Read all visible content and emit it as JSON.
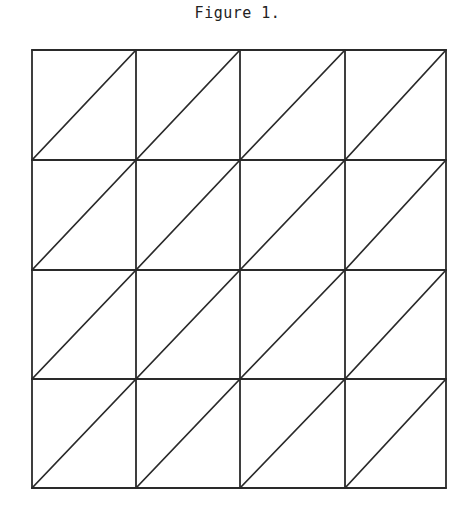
{
  "figure": {
    "title": "Figure 1.",
    "grid": {
      "rows": 4,
      "cols": 4,
      "diagonal": "bottom-left-to-top-right",
      "line_color": "#2a2a2a"
    }
  }
}
